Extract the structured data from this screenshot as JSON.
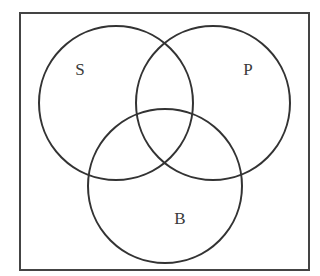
{
  "diagram": {
    "type": "venn",
    "universe": {
      "x": 20,
      "y": 13,
      "width": 289,
      "height": 257
    },
    "stroke_color": "#333333",
    "sets": [
      {
        "label": "S",
        "cx": 116,
        "cy": 103,
        "r": 77,
        "label_x": 80,
        "label_y": 75
      },
      {
        "label": "P",
        "cx": 213,
        "cy": 103,
        "r": 77,
        "label_x": 248,
        "label_y": 75
      },
      {
        "label": "B",
        "cx": 165,
        "cy": 186,
        "r": 77,
        "label_x": 180,
        "label_y": 224
      }
    ]
  }
}
